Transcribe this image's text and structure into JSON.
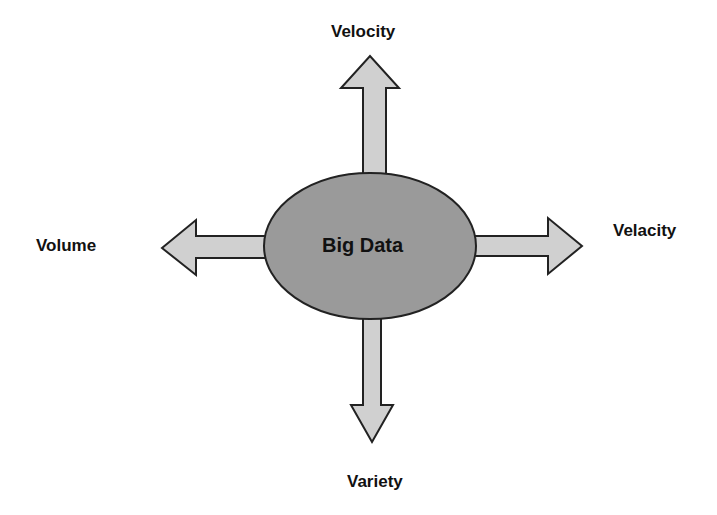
{
  "diagram": {
    "center": {
      "label": "Big Data",
      "fill": "#9a9a9a",
      "stroke": "#222222"
    },
    "arrow_fill": "#d0d0d0",
    "arrow_stroke": "#222222",
    "branches": {
      "top": {
        "label": "Velocity",
        "direction": "up"
      },
      "right": {
        "label": "Velacity",
        "direction": "right"
      },
      "left": {
        "label": "Volume",
        "direction": "left"
      },
      "bottom": {
        "label": "Variety",
        "direction": "down"
      }
    }
  }
}
